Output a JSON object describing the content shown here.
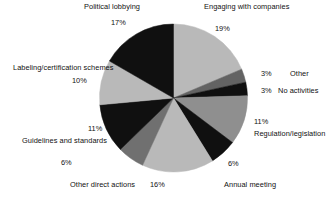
{
  "chart_data": {
    "type": "pie",
    "title": "",
    "subtitle": "",
    "xlabel": "",
    "ylabel": "",
    "legend_position": "none",
    "grid": false,
    "value_unit": "%",
    "start_angle_deg": 0,
    "direction": "clockwise",
    "center": {
      "x": 173.5,
      "y": 98
    },
    "radius": 74,
    "categories": [
      "Engaging with companies",
      "Other",
      "No activities",
      "Regulation/legislation",
      "Annual meeting",
      "",
      "Other direct actions",
      "Guidelines and standards",
      "Labeling/certification schemes",
      "Political lobbying"
    ],
    "values": [
      19,
      3,
      3,
      11,
      6,
      16,
      6,
      11,
      10,
      17
    ],
    "colors": [
      "#b9b9b9",
      "#636363",
      "#101010",
      "#8f8f8f",
      "#101010",
      "#b9b9b9",
      "#707070",
      "#101010",
      "#b9b9b9",
      "#101010"
    ],
    "slices": [
      {
        "label": "Engaging with companies",
        "value": 19,
        "display": "19%",
        "color": "#b9b9b9"
      },
      {
        "label": "Other",
        "value": 3,
        "display": "3%",
        "color": "#636363"
      },
      {
        "label": "No activities",
        "value": 3,
        "display": "3%",
        "color": "#101010"
      },
      {
        "label": "Regulation/legislation",
        "value": 11,
        "display": "11%",
        "color": "#8f8f8f"
      },
      {
        "label": "Annual meeting",
        "value": 6,
        "display": "6%",
        "color": "#101010"
      },
      {
        "label": "",
        "value": 16,
        "display": "16%",
        "color": "#b9b9b9"
      },
      {
        "label": "Other direct actions",
        "value": 6,
        "display": "6%",
        "color": "#707070"
      },
      {
        "label": "Guidelines and standards",
        "value": 11,
        "display": "11%",
        "color": "#101010"
      },
      {
        "label": "Labeling/certification schemes",
        "value": 10,
        "display": "10%",
        "color": "#b9b9b9"
      },
      {
        "label": "Political lobbying",
        "value": 17,
        "display": "17%",
        "color": "#101010"
      }
    ]
  },
  "labels": {
    "political_lobbying": "Political lobbying",
    "political_lobbying_pct": "17%",
    "engaging": "Engaging with companies",
    "engaging_pct": "19%",
    "other": "Other",
    "other_pct": "3%",
    "no_activities": "No activities",
    "no_activities_pct": "3%",
    "regulation": "Regulation/legislation",
    "regulation_pct": "11%",
    "annual_meeting": "Annual meeting",
    "annual_meeting_pct": "6%",
    "sixteen_pct": "16%",
    "other_direct_actions": "Other direct actions",
    "other_direct_actions_pct": "6%",
    "guidelines": "Guidelines and standards",
    "guidelines_pct": "11%",
    "labeling": "Labeling/certification schemes",
    "labeling_pct": "10%"
  }
}
